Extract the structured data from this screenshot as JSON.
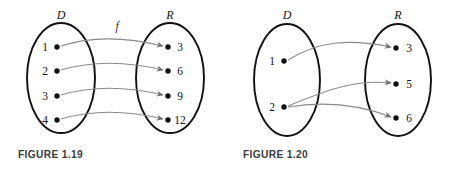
{
  "figures": [
    {
      "id": "figure-1-19",
      "caption": "FIGURE 1.19",
      "caption_x": 18,
      "caption_y": 158,
      "function_label": "f",
      "function_label_x": 117,
      "function_label_y": 30,
      "domain": {
        "label": "D",
        "label_x": 61,
        "label_y": 19,
        "cx": 61,
        "cy": 78,
        "rx": 34,
        "ry": 55,
        "elements": [
          {
            "text": "1",
            "text_x": 45,
            "text_y": 51,
            "dot_x": 57,
            "dot_y": 47
          },
          {
            "text": "2",
            "text_x": 45,
            "text_y": 75,
            "dot_x": 57,
            "dot_y": 71
          },
          {
            "text": "3",
            "text_x": 45,
            "text_y": 100,
            "dot_x": 57,
            "dot_y": 96
          },
          {
            "text": "4",
            "text_x": 45,
            "text_y": 124,
            "dot_x": 57,
            "dot_y": 120
          }
        ]
      },
      "range": {
        "label": "R",
        "label_x": 170,
        "label_y": 19,
        "cx": 170,
        "cy": 78,
        "rx": 34,
        "ry": 55,
        "elements": [
          {
            "text": "3",
            "text_x": 180,
            "text_y": 51,
            "dot_x": 168,
            "dot_y": 47
          },
          {
            "text": "6",
            "text_x": 180,
            "text_y": 75,
            "dot_x": 168,
            "dot_y": 71
          },
          {
            "text": "9",
            "text_x": 180,
            "text_y": 100,
            "dot_x": 168,
            "dot_y": 96
          },
          {
            "text": "12",
            "text_x": 180,
            "text_y": 124,
            "dot_x": 168,
            "dot_y": 120
          }
        ]
      },
      "mappings": [
        {
          "from": "1",
          "to": "3",
          "x1": 61,
          "y1": 46,
          "x2": 163,
          "y2": 46,
          "cx1": 95,
          "cy1": 35,
          "cx2": 130,
          "cy2": 38
        },
        {
          "from": "2",
          "to": "6",
          "x1": 61,
          "y1": 70,
          "x2": 163,
          "y2": 70,
          "cx1": 95,
          "cy1": 60,
          "cx2": 130,
          "cy2": 62
        },
        {
          "from": "3",
          "to": "9",
          "x1": 61,
          "y1": 95,
          "x2": 163,
          "y2": 95,
          "cx1": 95,
          "cy1": 85,
          "cx2": 130,
          "cy2": 87
        },
        {
          "from": "4",
          "to": "12",
          "x1": 61,
          "y1": 119,
          "x2": 163,
          "y2": 119,
          "cx1": 95,
          "cy1": 109,
          "cx2": 130,
          "cy2": 111
        }
      ]
    },
    {
      "id": "figure-1-20",
      "caption": "FIGURE 1.20",
      "caption_x": 243,
      "caption_y": 158,
      "function_label": "",
      "function_label_x": 0,
      "function_label_y": 0,
      "domain": {
        "label": "D",
        "label_x": 287,
        "label_y": 19,
        "cx": 287,
        "cy": 80,
        "rx": 33,
        "ry": 56,
        "elements": [
          {
            "text": "1",
            "text_x": 272,
            "text_y": 65,
            "dot_x": 284,
            "dot_y": 61
          },
          {
            "text": "2",
            "text_x": 272,
            "text_y": 111,
            "dot_x": 284,
            "dot_y": 107
          }
        ]
      },
      "range": {
        "label": "R",
        "label_x": 398,
        "label_y": 19,
        "cx": 398,
        "cy": 80,
        "rx": 33,
        "ry": 56,
        "elements": [
          {
            "text": "3",
            "text_x": 409,
            "text_y": 52,
            "dot_x": 396,
            "dot_y": 48
          },
          {
            "text": "5",
            "text_x": 409,
            "text_y": 88,
            "dot_x": 396,
            "dot_y": 84
          },
          {
            "text": "6",
            "text_x": 409,
            "text_y": 122,
            "dot_x": 396,
            "dot_y": 118
          }
        ]
      },
      "mappings": [
        {
          "from": "1",
          "to": "3",
          "x1": 288,
          "y1": 60,
          "x2": 391,
          "y2": 47,
          "cx1": 320,
          "cy1": 40,
          "cx2": 352,
          "cy2": 39
        },
        {
          "from": "2",
          "to": "5",
          "x1": 288,
          "y1": 106,
          "x2": 391,
          "y2": 83,
          "cx1": 322,
          "cy1": 92,
          "cx2": 354,
          "cy2": 79
        },
        {
          "from": "2",
          "to": "6",
          "x1": 288,
          "y1": 107,
          "x2": 391,
          "y2": 117,
          "cx1": 325,
          "cy1": 101,
          "cx2": 360,
          "cy2": 105
        }
      ]
    }
  ]
}
